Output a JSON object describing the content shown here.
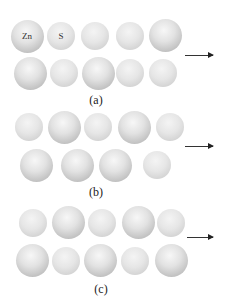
{
  "figure": {
    "panels": [
      {
        "label": "(a)",
        "label_pos": {
          "x": 96,
          "y": 93
        },
        "arrow": {
          "x1": 185,
          "x2": 213,
          "y": 55
        },
        "rows": [
          [
            {
              "x": 27,
              "y": 36,
              "size": "large",
              "text": "Zn"
            },
            {
              "x": 61,
              "y": 36,
              "size": "small",
              "text": "S"
            },
            {
              "x": 95,
              "y": 36,
              "size": "small",
              "text": ""
            },
            {
              "x": 130,
              "y": 36,
              "size": "small",
              "text": ""
            },
            {
              "x": 165,
              "y": 35,
              "size": "large",
              "text": ""
            }
          ],
          [
            {
              "x": 30,
              "y": 73,
              "size": "large",
              "text": ""
            },
            {
              "x": 64,
              "y": 73,
              "size": "small",
              "text": ""
            },
            {
              "x": 98,
              "y": 73,
              "size": "large",
              "text": ""
            },
            {
              "x": 130,
              "y": 73,
              "size": "small",
              "text": ""
            },
            {
              "x": 163,
              "y": 73,
              "size": "small",
              "text": ""
            }
          ]
        ]
      },
      {
        "label": "(b)",
        "label_pos": {
          "x": 96,
          "y": 185
        },
        "arrow": {
          "x1": 185,
          "x2": 213,
          "y": 146
        },
        "rows": [
          [
            {
              "x": 29,
              "y": 127,
              "size": "small",
              "text": ""
            },
            {
              "x": 64,
              "y": 127,
              "size": "large",
              "text": ""
            },
            {
              "x": 98,
              "y": 127,
              "size": "small",
              "text": ""
            },
            {
              "x": 134,
              "y": 127,
              "size": "large",
              "text": ""
            },
            {
              "x": 170,
              "y": 127,
              "size": "small",
              "text": ""
            }
          ],
          [
            {
              "x": 36,
              "y": 165,
              "size": "large",
              "text": ""
            },
            {
              "x": 77,
              "y": 165,
              "size": "large",
              "text": ""
            },
            {
              "x": 115,
              "y": 165,
              "size": "large",
              "text": ""
            },
            {
              "x": 157,
              "y": 165,
              "size": "small",
              "text": ""
            }
          ]
        ]
      },
      {
        "label": "(c)",
        "label_pos": {
          "x": 101,
          "y": 282
        },
        "arrow": {
          "x1": 187,
          "x2": 213,
          "y": 237
        },
        "rows": [
          [
            {
              "x": 33,
              "y": 223,
              "size": "small",
              "text": ""
            },
            {
              "x": 68,
              "y": 222,
              "size": "large",
              "text": ""
            },
            {
              "x": 102,
              "y": 223,
              "size": "small",
              "text": ""
            },
            {
              "x": 138,
              "y": 222,
              "size": "large",
              "text": ""
            },
            {
              "x": 171,
              "y": 223,
              "size": "small",
              "text": ""
            }
          ],
          [
            {
              "x": 32,
              "y": 260,
              "size": "large",
              "text": ""
            },
            {
              "x": 66,
              "y": 261,
              "size": "small",
              "text": ""
            },
            {
              "x": 100,
              "y": 260,
              "size": "large",
              "text": ""
            },
            {
              "x": 135,
              "y": 261,
              "size": "small",
              "text": ""
            },
            {
              "x": 171,
              "y": 260,
              "size": "large",
              "text": ""
            }
          ]
        ]
      }
    ],
    "sizes": {
      "large": 33,
      "small": 28
    },
    "legend": {
      "zn": "Zn",
      "s": "S"
    }
  }
}
